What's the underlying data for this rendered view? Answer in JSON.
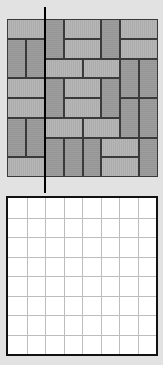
{
  "diagram": {
    "colors": {
      "background": "#e2e2e2",
      "horizontal_brick": "#b2b2b2",
      "vertical_brick": "#9a9a9a",
      "brick_outline": "#3a3a3a",
      "cut_line": "#000000",
      "empty_grid_fill": "#ffffff",
      "empty_grid_lines": "#bdbdbd",
      "empty_grid_border": "#111111"
    },
    "tile_board": {
      "rows": 8,
      "cols": 8,
      "bricks": [
        {
          "orientation": "h",
          "row": 0,
          "col": 0
        },
        {
          "orientation": "v",
          "row": 0,
          "col": 2
        },
        {
          "orientation": "h",
          "row": 0,
          "col": 3
        },
        {
          "orientation": "v",
          "row": 0,
          "col": 5
        },
        {
          "orientation": "h",
          "row": 0,
          "col": 6
        },
        {
          "orientation": "v",
          "row": 1,
          "col": 0
        },
        {
          "orientation": "v",
          "row": 1,
          "col": 1
        },
        {
          "orientation": "h",
          "row": 1,
          "col": 3
        },
        {
          "orientation": "h",
          "row": 1,
          "col": 6
        },
        {
          "orientation": "h",
          "row": 2,
          "col": 2
        },
        {
          "orientation": "h",
          "row": 2,
          "col": 4
        },
        {
          "orientation": "v",
          "row": 2,
          "col": 6
        },
        {
          "orientation": "v",
          "row": 2,
          "col": 7
        },
        {
          "orientation": "h",
          "row": 3,
          "col": 0
        },
        {
          "orientation": "v",
          "row": 3,
          "col": 2
        },
        {
          "orientation": "h",
          "row": 3,
          "col": 3
        },
        {
          "orientation": "v",
          "row": 3,
          "col": 5
        },
        {
          "orientation": "h",
          "row": 4,
          "col": 0
        },
        {
          "orientation": "h",
          "row": 4,
          "col": 3
        },
        {
          "orientation": "v",
          "row": 4,
          "col": 6
        },
        {
          "orientation": "v",
          "row": 4,
          "col": 7
        },
        {
          "orientation": "v",
          "row": 5,
          "col": 0
        },
        {
          "orientation": "v",
          "row": 5,
          "col": 1
        },
        {
          "orientation": "h",
          "row": 5,
          "col": 2
        },
        {
          "orientation": "h",
          "row": 5,
          "col": 4
        },
        {
          "orientation": "v",
          "row": 6,
          "col": 2
        },
        {
          "orientation": "v",
          "row": 6,
          "col": 3
        },
        {
          "orientation": "v",
          "row": 6,
          "col": 4
        },
        {
          "orientation": "h",
          "row": 6,
          "col": 5
        },
        {
          "orientation": "v",
          "row": 6,
          "col": 7
        },
        {
          "orientation": "h",
          "row": 7,
          "col": 0
        },
        {
          "orientation": "h",
          "row": 7,
          "col": 5
        }
      ]
    },
    "cut_line": {
      "orientation": "vertical",
      "position_between_cols": [
        1,
        2
      ]
    },
    "empty_grid": {
      "rows": 8,
      "cols": 8
    }
  }
}
